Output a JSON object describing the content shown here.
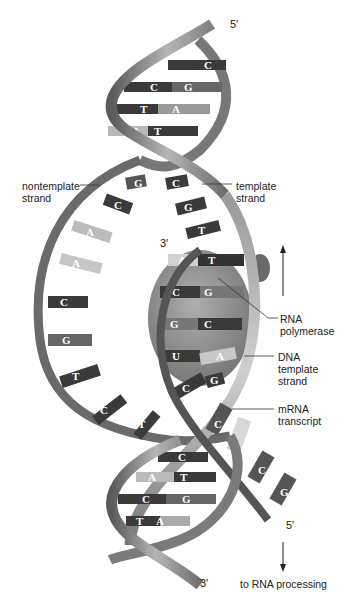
{
  "diagram": {
    "colors": {
      "background": "#ffffff",
      "ribbon": "#8a8a8a",
      "ribbon_dark": "#4a4a4a",
      "ribbon_light": "#c8c8c8",
      "base_dark": "#3a3a3a",
      "base_mid": "#6a6a6a",
      "base_light": "#b8b8b8",
      "polymerase": "#777777",
      "text": "#222222"
    },
    "ends": {
      "top_5prime": "5′",
      "rna_3prime": "3′",
      "mrna_5prime": "5′",
      "bottom_3prime": "3′"
    },
    "labels": {
      "nontemplate_strand": "nontemplate\nstrand",
      "template_strand": "template\nstrand",
      "rna_polymerase": "RNA\npolymerase",
      "dna_template_strand": "DNA\ntemplate\nstrand",
      "mrna_transcript": "mRNA\ntranscript",
      "to_rna_processing": "to RNA processing"
    },
    "top_helix_pairs": [
      {
        "left": "",
        "right": "C"
      },
      {
        "left": "C",
        "right": "G"
      },
      {
        "left": "T",
        "right": "A"
      },
      {
        "left": "A",
        "right": "T"
      }
    ],
    "unwound_nontemplate_bases": [
      "G",
      "C",
      "A",
      "A",
      "C",
      "G",
      "T",
      "C",
      "T"
    ],
    "unwound_template_bases": [
      "C",
      "G",
      "T"
    ],
    "rna_dna_hybrid_pairs": [
      {
        "rna": "A",
        "dna": "T"
      },
      {
        "rna": "C",
        "dna": "G"
      },
      {
        "rna": "G",
        "dna": "C"
      },
      {
        "rna": "U",
        "dna": "A"
      },
      {
        "rna": "C",
        "dna": "G"
      }
    ],
    "mrna_transcript_bases": [
      "C",
      "",
      "C",
      "G"
    ],
    "bottom_helix_pairs": [
      {
        "left": "",
        "right": "C"
      },
      {
        "left": "A",
        "right": "T"
      },
      {
        "left": "C",
        "right": "G"
      },
      {
        "left": "T",
        "right": "A"
      }
    ],
    "arrows": {
      "up_arrow": "direction of transcription",
      "down_arrow": "to RNA processing"
    }
  }
}
